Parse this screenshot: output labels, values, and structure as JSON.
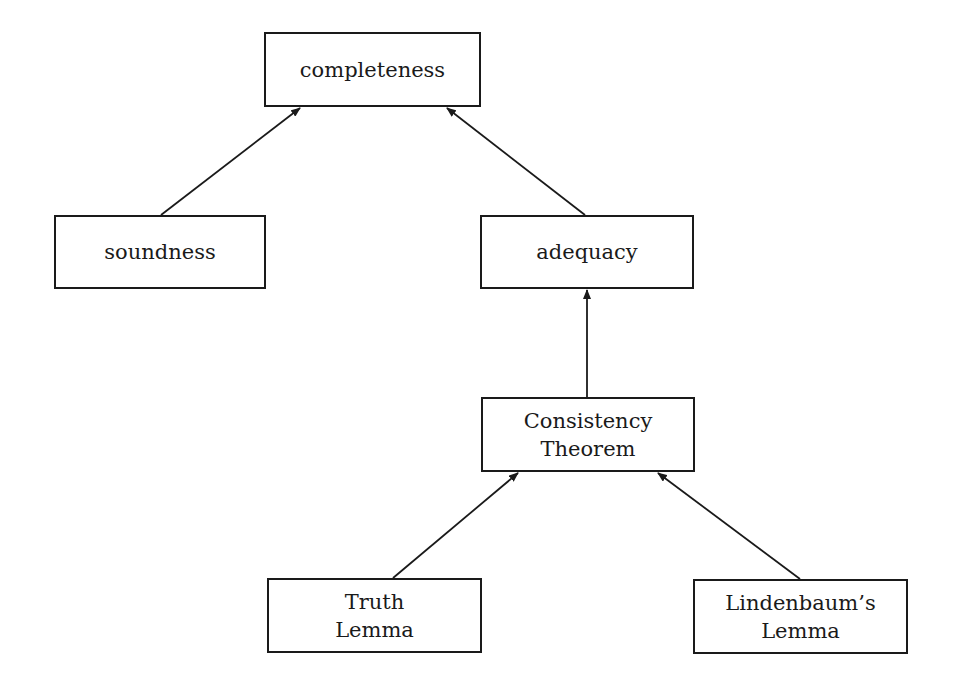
{
  "diagram": {
    "type": "dependency-graph",
    "colors": {
      "stroke": "#1a1a1a",
      "background": "#ffffff"
    },
    "nodes": {
      "completeness": {
        "lines": [
          "completeness"
        ],
        "box": [
          264,
          32,
          217,
          75
        ]
      },
      "soundness": {
        "lines": [
          "soundness"
        ],
        "box": [
          54,
          215,
          212,
          74
        ]
      },
      "adequacy": {
        "lines": [
          "adequacy"
        ],
        "box": [
          480,
          215,
          214,
          74
        ]
      },
      "consistency": {
        "lines": [
          "Consistency",
          "Theorem"
        ],
        "box": [
          481,
          397,
          214,
          75
        ]
      },
      "truth": {
        "lines": [
          "Truth",
          "Lemma"
        ],
        "box": [
          267,
          578,
          215,
          75
        ]
      },
      "lindenbaum": {
        "lines": [
          "Lindenbaum’s",
          "Lemma"
        ],
        "box": [
          693,
          579,
          215,
          75
        ]
      }
    },
    "edges": [
      {
        "from": "soundness",
        "to": "completeness"
      },
      {
        "from": "adequacy",
        "to": "completeness"
      },
      {
        "from": "consistency",
        "to": "adequacy"
      },
      {
        "from": "truth",
        "to": "consistency"
      },
      {
        "from": "lindenbaum",
        "to": "consistency"
      }
    ]
  }
}
